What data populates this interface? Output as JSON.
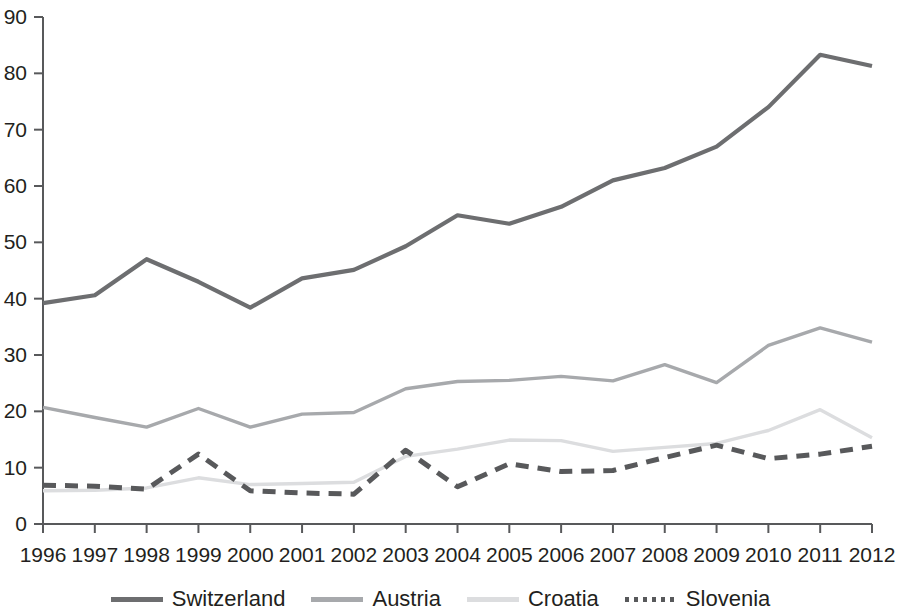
{
  "chart_data": {
    "type": "line",
    "title": "",
    "subtitle": "",
    "xlabel": "",
    "ylabel": "",
    "categories": [
      "1996",
      "1997",
      "1998",
      "1999",
      "2000",
      "2001",
      "2002",
      "2003",
      "2004",
      "2005",
      "2006",
      "2007",
      "2008",
      "2009",
      "2010",
      "2011",
      "2012"
    ],
    "x": [
      1996,
      1997,
      1998,
      1999,
      2000,
      2001,
      2002,
      2003,
      2004,
      2005,
      2006,
      2007,
      2008,
      2009,
      2010,
      2011,
      2012
    ],
    "ylim": [
      0,
      90
    ],
    "xlim": [
      1996,
      2012
    ],
    "yticks": [
      0,
      10,
      20,
      30,
      40,
      50,
      60,
      70,
      80,
      90
    ],
    "ytick_labels": [
      "0",
      "10",
      "20",
      "30",
      "40",
      "50",
      "60",
      "70",
      "80",
      "90"
    ],
    "grid": false,
    "legend_position": "bottom",
    "series": [
      {
        "name": "Switzerland",
        "color": "#6d6e70",
        "style": "solid",
        "width": 4.2,
        "values": [
          39.2,
          40.6,
          47.0,
          43.0,
          38.4,
          43.6,
          45.1,
          49.3,
          54.8,
          53.3,
          56.3,
          61.0,
          63.2,
          67.0,
          74.0,
          83.3,
          81.3
        ]
      },
      {
        "name": "Austria",
        "color": "#a7a9ac",
        "style": "solid",
        "width": 3.4,
        "values": [
          20.7,
          18.9,
          17.2,
          20.5,
          17.2,
          19.5,
          19.8,
          24.0,
          25.3,
          25.5,
          26.2,
          25.4,
          28.3,
          25.1,
          31.7,
          34.8,
          32.3
        ]
      },
      {
        "name": "Croatia",
        "color": "#dcdddf",
        "style": "solid",
        "width": 3.4,
        "values": [
          5.9,
          6.0,
          6.4,
          8.2,
          7.0,
          7.2,
          7.4,
          12.0,
          13.3,
          14.9,
          14.8,
          12.9,
          13.6,
          14.3,
          16.6,
          20.3,
          15.3
        ]
      },
      {
        "name": "Slovenia",
        "color": "#58595b",
        "style": "dashed",
        "width": 5.0,
        "values": [
          6.9,
          6.7,
          6.2,
          12.4,
          5.9,
          5.5,
          5.3,
          13.1,
          6.6,
          10.7,
          9.3,
          9.5,
          11.8,
          14.0,
          11.6,
          12.4,
          13.8
        ]
      }
    ],
    "legend": [
      {
        "label": "Switzerland",
        "color": "#6d6e70",
        "style": "solid"
      },
      {
        "label": "Austria",
        "color": "#a7a9ac",
        "style": "solid"
      },
      {
        "label": "Croatia",
        "color": "#dcdddf",
        "style": "solid"
      },
      {
        "label": "Slovenia",
        "color": "#58595b",
        "style": "dotted"
      }
    ],
    "axis_color": "#58595b"
  }
}
